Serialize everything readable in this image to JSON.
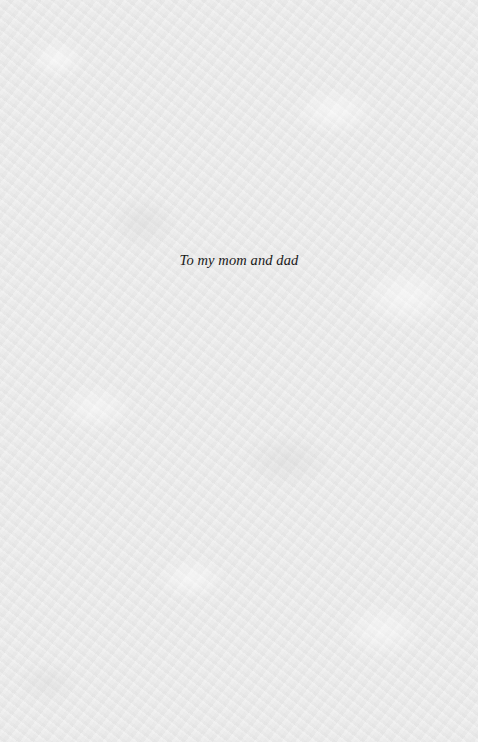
{
  "page": {
    "type": "dedication",
    "background_color": "#ebebeb",
    "text_color": "#1a1a1a"
  },
  "dedication": {
    "text": "To my mom and dad"
  }
}
